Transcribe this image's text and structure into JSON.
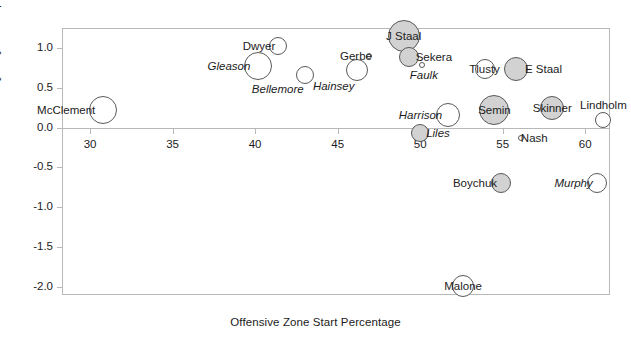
{
  "chart_data": {
    "type": "scatter",
    "title": "",
    "xlabel": "Offensive Zone Start Percentage",
    "ylabel": "Quality of Competition",
    "xlim": [
      28.3,
      61.5
    ],
    "ylim": [
      -2.1,
      1.25
    ],
    "xticks": [
      30,
      35,
      40,
      45,
      50,
      55,
      60
    ],
    "xticklabels": [
      "30",
      "35",
      "40",
      "45",
      "50",
      "55",
      "60"
    ],
    "yticks": [
      1.0,
      0.5,
      0.0,
      -0.5,
      -1.0,
      -1.5,
      -2.0
    ],
    "yticklabels": [
      "1.0",
      "0.5",
      "0.0",
      "-0.5",
      "-1.0",
      "-1.5",
      "-2.0"
    ],
    "grid": false,
    "legend": "none",
    "marker_encoding": {
      "size": "bubble area encodes a third variable",
      "fill_open": "#ffffff",
      "fill_shaded": "#d2d2d2",
      "edge": "#595959"
    },
    "points": [
      {
        "label": "McClement",
        "x": 30.8,
        "y": 0.22,
        "size": 14,
        "fill": "open",
        "label_pos": "left"
      },
      {
        "label": "Gleason",
        "x": 40.2,
        "y": 0.77,
        "size": 14,
        "fill": "open",
        "label_pos": "left"
      },
      {
        "label": "Dwyer",
        "x": 41.4,
        "y": 1.02,
        "size": 9,
        "fill": "open",
        "label_pos": "left"
      },
      {
        "label": "Bellemore",
        "x": 43.0,
        "y": 0.66,
        "size": 9,
        "fill": "open",
        "label_pos": "below-left"
      },
      {
        "label": "Hainsey",
        "x": 46.2,
        "y": 0.72,
        "size": 11,
        "fill": "open",
        "label_pos": "below-left"
      },
      {
        "label": "Gerbe",
        "x": 46.9,
        "y": 0.9,
        "size": 3,
        "fill": "open",
        "label_pos": "left"
      },
      {
        "label": "J Staal",
        "x": 49.0,
        "y": 1.15,
        "size": 16,
        "fill": "shaded",
        "label_pos": "center"
      },
      {
        "label": "Sekera",
        "x": 49.3,
        "y": 0.88,
        "size": 10,
        "fill": "shaded",
        "label_pos": "right"
      },
      {
        "label": "Faulk",
        "x": 50.1,
        "y": 0.79,
        "size": 3,
        "fill": "open",
        "label_pos": "below"
      },
      {
        "label": "Tlusty",
        "x": 53.9,
        "y": 0.74,
        "size": 10,
        "fill": "open",
        "label_pos": "center"
      },
      {
        "label": "E Staal",
        "x": 55.8,
        "y": 0.74,
        "size": 12,
        "fill": "shaded",
        "label_pos": "right"
      },
      {
        "label": "Harrison",
        "x": 51.7,
        "y": 0.16,
        "size": 12,
        "fill": "open",
        "label_pos": "left"
      },
      {
        "label": "Semin",
        "x": 54.5,
        "y": 0.22,
        "size": 15,
        "fill": "shaded",
        "label_pos": "center"
      },
      {
        "label": "Skinner",
        "x": 58.0,
        "y": 0.25,
        "size": 12,
        "fill": "shaded",
        "label_pos": "center"
      },
      {
        "label": "Lindholm",
        "x": 61.1,
        "y": 0.09,
        "size": 8,
        "fill": "open",
        "label_pos": "above"
      },
      {
        "label": "Liles",
        "x": 50.0,
        "y": -0.07,
        "size": 9,
        "fill": "shaded",
        "label_pos": "right"
      },
      {
        "label": "Nash",
        "x": 56.1,
        "y": -0.13,
        "size": 3,
        "fill": "open",
        "label_pos": "right"
      },
      {
        "label": "Boychuk",
        "x": 54.9,
        "y": -0.69,
        "size": 10,
        "fill": "shaded",
        "label_pos": "left"
      },
      {
        "label": "Murphy",
        "x": 60.7,
        "y": -0.69,
        "size": 10,
        "fill": "open",
        "label_pos": "left"
      },
      {
        "label": "Malone",
        "x": 52.6,
        "y": -1.99,
        "size": 11,
        "fill": "open",
        "label_pos": "center"
      }
    ]
  }
}
